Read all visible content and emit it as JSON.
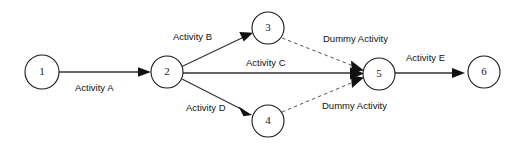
{
  "diagram": {
    "type": "activity-on-arrow-network",
    "background_color": "#ffffff",
    "line_color": "#333333",
    "node_stroke_color": "#1a1a1a",
    "text_color": "#111111",
    "nodes": [
      {
        "id": "node-1",
        "label": "1",
        "cx": 42,
        "cy": 72,
        "r": 17
      },
      {
        "id": "node-2",
        "label": "2",
        "cx": 167,
        "cy": 72,
        "r": 16
      },
      {
        "id": "node-3",
        "label": "3",
        "cx": 268,
        "cy": 28,
        "r": 16
      },
      {
        "id": "node-4",
        "label": "4",
        "cx": 268,
        "cy": 121,
        "r": 16
      },
      {
        "id": "node-5",
        "label": "5",
        "cx": 379,
        "cy": 74,
        "r": 16
      },
      {
        "id": "node-6",
        "label": "6",
        "cx": 484,
        "cy": 72,
        "r": 16
      }
    ],
    "edges": [
      {
        "id": "edge-a",
        "label": "Activity A",
        "from": "node-1",
        "to": "node-2",
        "style": "solid",
        "label_x": 75,
        "label_y": 88
      },
      {
        "id": "edge-b",
        "label": "Activity B",
        "from": "node-2",
        "to": "node-3",
        "style": "solid",
        "label_x": 173,
        "label_y": 37
      },
      {
        "id": "edge-c",
        "label": "Activity C",
        "from": "node-2",
        "to": "node-5",
        "style": "solid",
        "label_x": 246,
        "label_y": 63
      },
      {
        "id": "edge-d",
        "label": "Activity D",
        "from": "node-2",
        "to": "node-4",
        "style": "solid",
        "label_x": 186,
        "label_y": 108
      },
      {
        "id": "edge-dummy-1",
        "label": "Dummy Activity",
        "from": "node-3",
        "to": "node-5",
        "style": "dashed",
        "label_x": 323,
        "label_y": 39
      },
      {
        "id": "edge-dummy-2",
        "label": "Dummy Activity",
        "from": "node-4",
        "to": "node-5",
        "style": "dashed",
        "label_x": 322,
        "label_y": 106
      },
      {
        "id": "edge-e",
        "label": "Activity E",
        "from": "node-5",
        "to": "node-6",
        "style": "solid",
        "label_x": 406,
        "label_y": 58
      }
    ]
  }
}
